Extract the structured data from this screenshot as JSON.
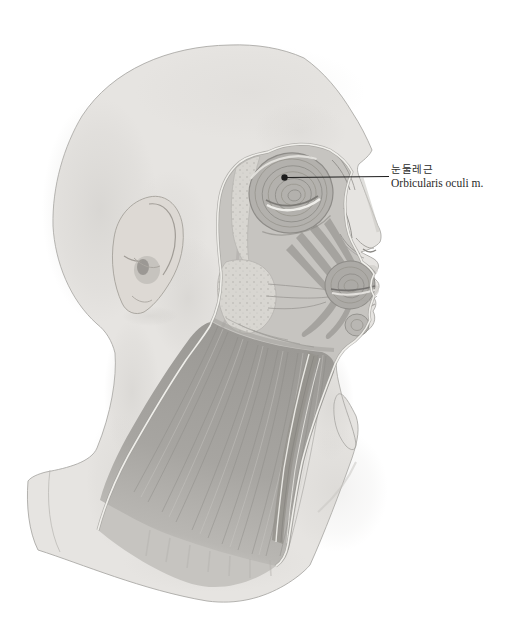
{
  "figure": {
    "annotation": {
      "korean": "눈둘레근",
      "latin": "Orbicularis oculi m."
    }
  },
  "colors": {
    "background": "#ffffff",
    "skin": "#e6e4e1",
    "skin_shadow": "#c6c4c0",
    "dissection_base": "#c6c4c0",
    "muscle": "#a8a6a2",
    "muscle_deep": "#8a8884",
    "fascia_white": "#f3f2ee",
    "fat_stipple": "#d8d6d1",
    "outline": "#a4a29e",
    "leader_line": "#1c1c1c",
    "label_text": "#2b2b2b"
  }
}
